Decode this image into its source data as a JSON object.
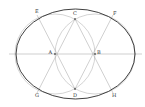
{
  "diagram": {
    "colors": {
      "oval": "#2a2a2a",
      "construction": "#a0a0a0",
      "axis": "#b0b0b0",
      "label": "#333333"
    },
    "points": {
      "A": {
        "label": "A",
        "x": 55,
        "y": 54
      },
      "B": {
        "label": "B",
        "x": 95,
        "y": 54
      },
      "C": {
        "label": "C",
        "x": 75,
        "y": 19
      },
      "D": {
        "label": "D",
        "x": 75,
        "y": 89
      },
      "E": {
        "label": "E",
        "x": 37,
        "y": 15
      },
      "F": {
        "label": "F",
        "x": 113,
        "y": 15
      },
      "G": {
        "label": "G",
        "x": 37,
        "y": 93
      },
      "H": {
        "label": "H",
        "x": 113,
        "y": 93
      }
    },
    "labels": {
      "A": "A",
      "B": "B",
      "C": "C",
      "D": "D",
      "E": "E",
      "F": "F",
      "G": "G",
      "H": "H"
    }
  }
}
